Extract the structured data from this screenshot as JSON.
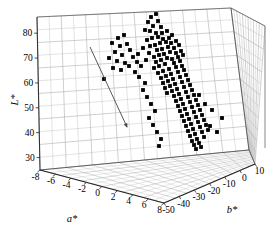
{
  "figure": {
    "type": "3d-scatter",
    "background": "#ffffff",
    "marker_color": "#000000",
    "grid_color": "#9a9a9a",
    "axis_color": "#222222",
    "annotation_arrow_color": "#444444"
  },
  "axes": {
    "l_star": {
      "label": "L*",
      "ticks": [
        "30",
        "40",
        "50",
        "60",
        "70",
        "80"
      ],
      "min": 25,
      "max": 85
    },
    "a_star": {
      "label": "a*",
      "ticks": [
        "-8",
        "-6",
        "-4",
        "-2",
        "0",
        "2",
        "4",
        "6",
        "8"
      ],
      "min": -9,
      "max": 9
    },
    "b_star": {
      "label": "b*",
      "ticks": [
        "-50",
        "-40",
        "-30",
        "-20",
        "-10",
        "0",
        "10"
      ],
      "min": -55,
      "max": 15
    }
  },
  "annotations": [
    {
      "name": "trend-arrow",
      "kind": "arrow",
      "from": [
        90,
        47
      ],
      "to": [
        127,
        127
      ]
    }
  ],
  "chart_data": {
    "type": "scatter",
    "title": "",
    "xlabel": "a*",
    "ylabel": "L*",
    "zlabel": "b*",
    "xlim": [
      -9,
      9
    ],
    "ylim": [
      25,
      85
    ],
    "zlim": [
      -55,
      15
    ],
    "grid": true,
    "legend": "none",
    "series": [
      {
        "name": "samples",
        "marker": "square",
        "color": "#000000",
        "points_px": [
          [
            151,
            17
          ],
          [
            156,
            14
          ],
          [
            148,
            22
          ],
          [
            158,
            21
          ],
          [
            153,
            26
          ],
          [
            161,
            27
          ],
          [
            145,
            30
          ],
          [
            150,
            31
          ],
          [
            156,
            33
          ],
          [
            162,
            33
          ],
          [
            167,
            31
          ],
          [
            158,
            37
          ],
          [
            152,
            38
          ],
          [
            147,
            40
          ],
          [
            163,
            39
          ],
          [
            169,
            38
          ],
          [
            172,
            35
          ],
          [
            166,
            42
          ],
          [
            160,
            43
          ],
          [
            155,
            45
          ],
          [
            150,
            46
          ],
          [
            171,
            43
          ],
          [
            176,
            41
          ],
          [
            168,
            47
          ],
          [
            162,
            49
          ],
          [
            157,
            50
          ],
          [
            174,
            48
          ],
          [
            179,
            45
          ],
          [
            170,
            52
          ],
          [
            164,
            54
          ],
          [
            159,
            55
          ],
          [
            154,
            57
          ],
          [
            176,
            53
          ],
          [
            181,
            51
          ],
          [
            167,
            58
          ],
          [
            161,
            60
          ],
          [
            156,
            62
          ],
          [
            172,
            59
          ],
          [
            178,
            57
          ],
          [
            183,
            55
          ],
          [
            165,
            64
          ],
          [
            159,
            66
          ],
          [
            154,
            68
          ],
          [
            174,
            63
          ],
          [
            180,
            61
          ],
          [
            169,
            69
          ],
          [
            163,
            71
          ],
          [
            158,
            73
          ],
          [
            176,
            67
          ],
          [
            182,
            66
          ],
          [
            171,
            74
          ],
          [
            166,
            76
          ],
          [
            161,
            78
          ],
          [
            178,
            72
          ],
          [
            184,
            70
          ],
          [
            173,
            79
          ],
          [
            168,
            81
          ],
          [
            163,
            83
          ],
          [
            180,
            77
          ],
          [
            186,
            75
          ],
          [
            175,
            84
          ],
          [
            170,
            86
          ],
          [
            165,
            88
          ],
          [
            182,
            82
          ],
          [
            188,
            80
          ],
          [
            177,
            89
          ],
          [
            172,
            91
          ],
          [
            167,
            93
          ],
          [
            184,
            87
          ],
          [
            190,
            85
          ],
          [
            179,
            94
          ],
          [
            174,
            96
          ],
          [
            186,
            92
          ],
          [
            192,
            90
          ],
          [
            181,
            99
          ],
          [
            176,
            101
          ],
          [
            188,
            97
          ],
          [
            194,
            95
          ],
          [
            183,
            104
          ],
          [
            178,
            106
          ],
          [
            190,
            102
          ],
          [
            196,
            100
          ],
          [
            185,
            109
          ],
          [
            180,
            111
          ],
          [
            192,
            107
          ],
          [
            198,
            105
          ],
          [
            187,
            114
          ],
          [
            182,
            116
          ],
          [
            194,
            112
          ],
          [
            200,
            110
          ],
          [
            189,
            119
          ],
          [
            184,
            121
          ],
          [
            196,
            117
          ],
          [
            202,
            115
          ],
          [
            191,
            124
          ],
          [
            186,
            126
          ],
          [
            198,
            122
          ],
          [
            204,
            120
          ],
          [
            193,
            129
          ],
          [
            188,
            131
          ],
          [
            200,
            127
          ],
          [
            206,
            125
          ],
          [
            195,
            134
          ],
          [
            190,
            136
          ],
          [
            202,
            132
          ],
          [
            208,
            130
          ],
          [
            197,
            139
          ],
          [
            192,
            141
          ],
          [
            204,
            137
          ],
          [
            199,
            143
          ],
          [
            194,
            145
          ],
          [
            201,
            147
          ],
          [
            196,
            149
          ],
          [
            118,
            38
          ],
          [
            124,
            35
          ],
          [
            112,
            43
          ],
          [
            120,
            46
          ],
          [
            127,
            44
          ],
          [
            115,
            52
          ],
          [
            122,
            55
          ],
          [
            130,
            50
          ],
          [
            109,
            58
          ],
          [
            117,
            61
          ],
          [
            125,
            63
          ],
          [
            133,
            57
          ],
          [
            113,
            68
          ],
          [
            121,
            70
          ],
          [
            129,
            66
          ],
          [
            137,
            62
          ],
          [
            104,
            79
          ],
          [
            159,
            146
          ],
          [
            143,
            48
          ],
          [
            138,
            54
          ],
          [
            146,
            60
          ],
          [
            141,
            66
          ],
          [
            135,
            72
          ],
          [
            149,
            53
          ],
          [
            205,
            104
          ],
          [
            212,
            110
          ],
          [
            199,
            95
          ],
          [
            210,
            126
          ],
          [
            217,
            132
          ],
          [
            222,
            118
          ],
          [
            143,
            90
          ],
          [
            147,
            97
          ],
          [
            151,
            104
          ],
          [
            155,
            111
          ],
          [
            149,
            118
          ],
          [
            153,
            125
          ],
          [
            157,
            132
          ],
          [
            161,
            139
          ],
          [
            145,
            83
          ],
          [
            139,
            77
          ]
        ]
      }
    ]
  }
}
